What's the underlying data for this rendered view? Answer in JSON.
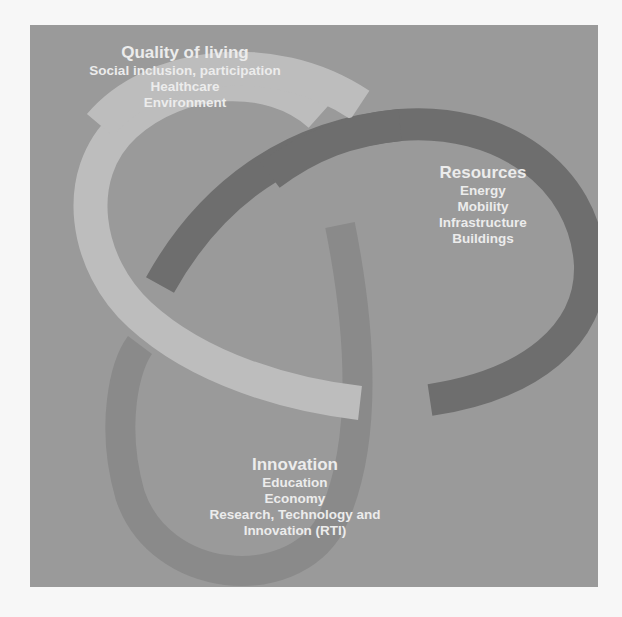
{
  "diagram": {
    "colors": {
      "background": "#9a9a9a",
      "ring_quality": "#bdbdbd",
      "ring_resources": "#6e6e6e",
      "ring_innovation": "#8a8a8a",
      "text": "#ececec"
    },
    "sections": [
      {
        "title": "Quality of living",
        "items": [
          "Social inclusion, participation",
          "Healthcare",
          "Environment"
        ]
      },
      {
        "title": "Resources",
        "items": [
          "Energy",
          "Mobility",
          "Infrastructure",
          "Buildings"
        ]
      },
      {
        "title": "Innovation",
        "items": [
          "Education",
          "Economy",
          "Research, Technology and",
          "Innovation (RTI)"
        ]
      }
    ]
  }
}
